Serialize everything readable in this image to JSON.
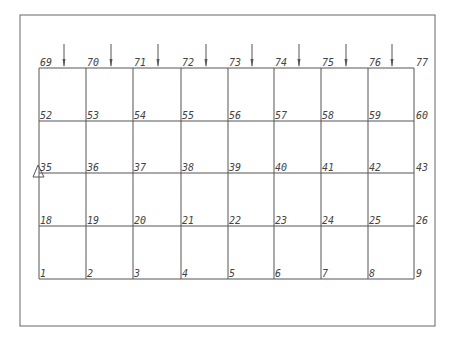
{
  "diagram": {
    "type": "structural-frame-grid",
    "frame": {
      "x1": 20,
      "y1": 15,
      "x2": 435,
      "y2": 326
    },
    "columns_x": [
      39,
      86,
      133,
      181,
      228,
      274,
      321,
      368,
      414
    ],
    "rows_y": [
      68,
      121,
      173,
      226,
      279
    ],
    "node_rows": [
      [
        "69",
        "70",
        "71",
        "72",
        "73",
        "74",
        "75",
        "76",
        "77"
      ],
      [
        "52",
        "53",
        "54",
        "55",
        "56",
        "57",
        "58",
        "59",
        "60"
      ],
      [
        "35",
        "36",
        "37",
        "38",
        "39",
        "40",
        "41",
        "42",
        "43"
      ],
      [
        "18",
        "19",
        "20",
        "21",
        "22",
        "23",
        "24",
        "25",
        "26"
      ],
      [
        "1",
        "2",
        "3",
        "4",
        "5",
        "6",
        "7",
        "8",
        "9"
      ]
    ],
    "load_arrows": {
      "count": 8,
      "y_start": 44,
      "y_end": 68,
      "position": "mid-span of each top bay",
      "direction": "down"
    },
    "support": {
      "type": "pin-triangle",
      "node": "35"
    },
    "colors": {
      "line": "#555555",
      "label": "#444444",
      "frame": "#666666"
    }
  }
}
